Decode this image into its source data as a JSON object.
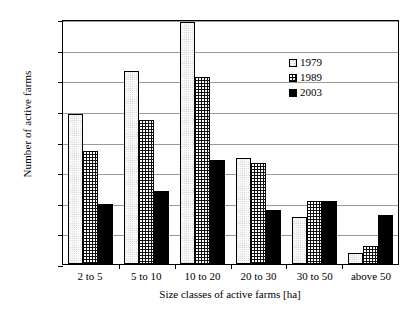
{
  "chart_data": {
    "type": "bar",
    "title": "",
    "xlabel": "Size classes of active farms [ha]",
    "ylabel": "Number of active farms",
    "categories": [
      "2 to 5",
      "5 to 10",
      "10 to 20",
      "20 to 30",
      "30 to 50",
      "above 50"
    ],
    "series": [
      {
        "name": "1979",
        "values": [
          49000,
          63000,
          79000,
          34500,
          15500,
          3500
        ]
      },
      {
        "name": "1989",
        "values": [
          37000,
          47000,
          61000,
          33000,
          20500,
          6000
        ]
      },
      {
        "name": "2003",
        "values": [
          19500,
          24000,
          34000,
          17500,
          20500,
          16000
        ]
      }
    ],
    "ylim": [
      0,
      80000
    ],
    "ytick_labels": [
      "80.000",
      "70.000",
      "60.000",
      "50.000",
      "40.000",
      "30.000",
      "20.000",
      "10.000",
      "0"
    ],
    "ytick_values": [
      80000,
      70000,
      60000,
      50000,
      40000,
      30000,
      20000,
      10000,
      0
    ],
    "grid": true,
    "legend_position": "top-right",
    "legend_entries": [
      "1979",
      "1989",
      "2003"
    ]
  }
}
